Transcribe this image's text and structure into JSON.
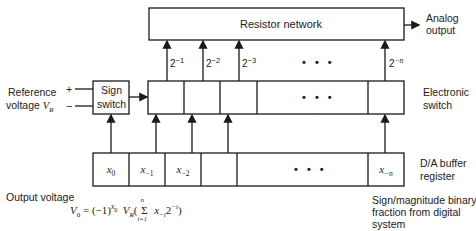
{
  "diagram": {
    "blocks": {
      "resistor_network": "Resistor network",
      "sign_switch_line1": "Sign",
      "sign_switch_line2": "switch",
      "electronic_switch_line1": "Electronic",
      "electronic_switch_line2": "switch",
      "buffer_line1": "D/A buffer",
      "buffer_line2": "register"
    },
    "inputs": {
      "reference_line1": "Reference",
      "reference_line2": "voltage",
      "reference_symbol": "V",
      "reference_sub": "R",
      "plus": "+",
      "minus": "−"
    },
    "output": {
      "line1": "Analog",
      "line2": "output"
    },
    "weights": [
      {
        "base": "2",
        "exp": "−1"
      },
      {
        "base": "2",
        "exp": "−2"
      },
      {
        "base": "2",
        "exp": "−3"
      },
      {
        "base": "2",
        "exp": "−n"
      }
    ],
    "ellipsis": "• • •",
    "register_cells": [
      {
        "var": "x",
        "sub": "0"
      },
      {
        "var": "x",
        "sub": "−1"
      },
      {
        "var": "x",
        "sub": "−2"
      },
      {
        "var": "",
        "sub": ""
      },
      {
        "var": "x",
        "sub": "−n"
      }
    ],
    "source_note": {
      "line1": "Sign/magnitude binary",
      "line2": "fraction from digital",
      "line3": "system"
    },
    "formula": {
      "label": "Output voltage",
      "lhs": "V",
      "lhs_sub": "0",
      "eq": " = (−1)",
      "exp": "x",
      "exp_sub": "0",
      "vr": "V",
      "vr_sub": "R",
      "open": "(",
      "sigma": "Σ",
      "sum_top": "n",
      "sum_bottom": "i=1",
      "term": "x",
      "term_sub": "−i",
      "two": "2",
      "two_exp": "−i",
      "close": ")"
    }
  }
}
